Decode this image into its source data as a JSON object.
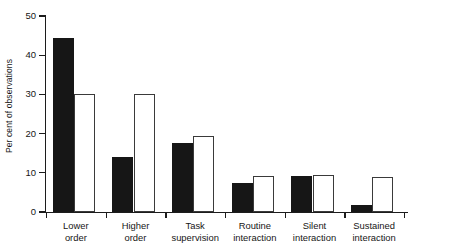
{
  "chart_data": {
    "type": "bar",
    "title": "",
    "subtitle": "",
    "xlabel": "",
    "ylabel": "Per cent of observations",
    "ylim": [
      0,
      50
    ],
    "yticks": [
      0,
      10,
      20,
      30,
      40,
      50
    ],
    "ytick_labels": [
      "0",
      "10",
      "20",
      "30",
      "40",
      "50"
    ],
    "grid": false,
    "legend": null,
    "legend_position": "none",
    "grouped": true,
    "categories": [
      "Lower order",
      "Higher order",
      "Task supervision",
      "Routine interaction",
      "Silent interaction",
      "Sustained interaction"
    ],
    "category_lines": [
      [
        "Lower",
        "order"
      ],
      [
        "Higher",
        "order"
      ],
      [
        "Task",
        "supervision"
      ],
      [
        "Routine",
        "interaction"
      ],
      [
        "Silent",
        "interaction"
      ],
      [
        "Sustained",
        "interaction"
      ]
    ],
    "series": [
      {
        "name": "filled",
        "style": "solid-black",
        "color": "#161616",
        "values": [
          44.5,
          14.0,
          17.7,
          7.3,
          9.2,
          1.8
        ]
      },
      {
        "name": "open",
        "style": "open-white-outline",
        "color": "#ffffff",
        "edge_color": "#3a3a3a",
        "values": [
          30.0,
          30.2,
          19.3,
          9.1,
          9.4,
          9.0
        ]
      }
    ]
  },
  "axes": {
    "y_axis_color": "#1c1c1c",
    "x_axis_color": "#1c1c1c",
    "background": "#ffffff"
  }
}
